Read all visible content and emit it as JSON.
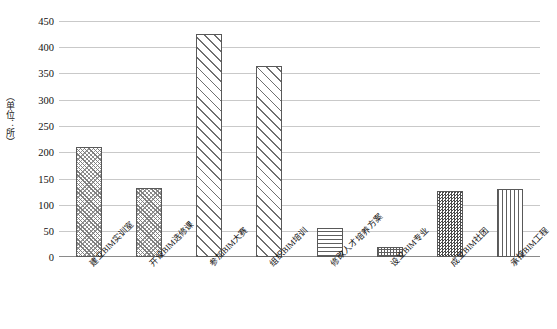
{
  "chart_data": {
    "type": "bar",
    "title": "",
    "subtitle": "",
    "xlabel": "",
    "ylabel": "（单位：所）",
    "categories": [
      "建立BIM实训室",
      "开设BIM选修课",
      "参加BIM大赛",
      "组织BIM培训",
      "修改人才培养方案",
      "设立BIM专业",
      "成立BIM社团",
      "承接BIM工程"
    ],
    "values": [
      210,
      132,
      425,
      365,
      56,
      20,
      125,
      130
    ],
    "ylim": [
      0,
      450
    ],
    "ytick_step": 50,
    "yticks": [
      450,
      400,
      350,
      300,
      250,
      200,
      150,
      100,
      50,
      0
    ],
    "grid": true,
    "legend": "none",
    "series": [
      {
        "name": "院校数量",
        "values": [
          210,
          132,
          425,
          365,
          56,
          20,
          125,
          130
        ]
      }
    ],
    "bar_patterns": [
      "diagonal-dense",
      "diagonal-dense",
      "diagonal-wide",
      "diagonal-wide",
      "horizontal-lines",
      "grid-crosshatch",
      "checkerboard",
      "vertical-lines"
    ],
    "colors": {
      "bar_outline": "#595959",
      "gridline": "#c9c9c9",
      "baseline": "#8a8a8a",
      "text": "#101010",
      "background": "#ffffff"
    }
  }
}
